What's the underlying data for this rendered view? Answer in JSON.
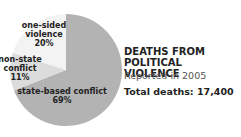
{
  "chart_data": {
    "type": "pie",
    "title": "DEATHS FROM POLITICAL VIOLENCE",
    "subtitle": "Reported in 2005",
    "total_label": "Total deaths: 17,400",
    "categories": [
      "state-based conflict",
      "non-state conflict",
      "one-sided violence"
    ],
    "values": [
      69,
      11,
      20
    ],
    "unit": "%",
    "colors": [
      "#b3b3b3",
      "#dcdcdc",
      "#f3f3f3"
    ]
  },
  "title_line1": "DEATHS FROM",
  "title_line2": "POLITICAL VIOLENCE",
  "subtitle": "Reported in 2005",
  "total": "Total deaths: 17,400",
  "labels": {
    "one_sided_1": "one-sided",
    "one_sided_2": "violence",
    "one_sided_3": "20%",
    "non_state_1": "non-state",
    "non_state_2": "conflict",
    "non_state_3": "11%",
    "state_1": "state-based conflict",
    "state_2": "69%"
  }
}
